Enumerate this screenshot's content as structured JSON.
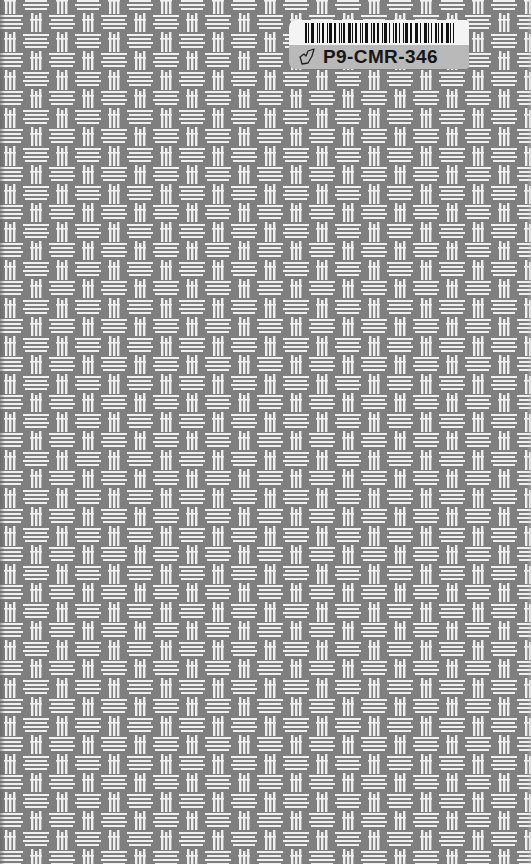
{
  "cover": {
    "pattern": "basket-weave",
    "background_color": "#7f7f7f",
    "strand_color": "#f0f0f0"
  },
  "label": {
    "barcode_text": "",
    "id_text": "P9-CMR-346",
    "icon": "leaf-outline-icon",
    "top_color": "#f4f4f4",
    "bottom_color": "#b9b9b9"
  }
}
